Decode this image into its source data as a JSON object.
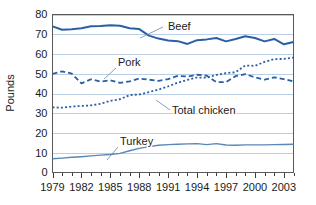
{
  "chart_data": {
    "type": "line",
    "title": "",
    "xlabel": "",
    "ylabel": "Pounds",
    "xlim": [
      1979,
      2004
    ],
    "ylim": [
      0,
      80
    ],
    "ytick_step": 10,
    "grid": true,
    "grid_axis": "y",
    "legend_position": "inline-annotations",
    "x": [
      1979,
      1980,
      1981,
      1982,
      1983,
      1984,
      1985,
      1986,
      1987,
      1988,
      1989,
      1990,
      1991,
      1992,
      1993,
      1994,
      1995,
      1996,
      1997,
      1998,
      1999,
      2000,
      2001,
      2002,
      2003,
      2004
    ],
    "yticks": [
      0,
      10,
      20,
      30,
      40,
      50,
      60,
      70,
      80
    ],
    "ytick_labels": [
      "0",
      "10",
      "20",
      "30",
      "40",
      "50",
      "60",
      "70",
      "80"
    ],
    "xtick_labels": [
      "1979",
      "1982",
      "1985",
      "1988",
      "1991",
      "1994",
      "1997",
      "2000",
      "2003"
    ],
    "xticks_labeled": [
      1979,
      1982,
      1985,
      1988,
      1991,
      1994,
      1997,
      2000,
      2003
    ],
    "series": [
      {
        "name": "Beef",
        "style": "solid",
        "color": "#2a5fa5",
        "width": 2.0,
        "values": [
          74.0,
          72.3,
          72.5,
          73.0,
          74.0,
          74.2,
          74.6,
          74.3,
          73.0,
          72.6,
          69.3,
          67.8,
          66.8,
          66.5,
          65.1,
          67.0,
          67.4,
          68.1,
          66.4,
          67.6,
          69.0,
          68.1,
          66.4,
          67.6,
          64.9,
          66.1
        ]
      },
      {
        "name": "Pork",
        "style": "dashed",
        "color": "#2a5fa5",
        "width": 1.8,
        "values": [
          49.9,
          51.2,
          50.1,
          45.1,
          47.2,
          46.0,
          46.7,
          45.4,
          46.1,
          47.6,
          47.0,
          46.4,
          47.3,
          48.9,
          48.6,
          49.5,
          49.0,
          45.8,
          45.8,
          48.8,
          49.8,
          48.2,
          47.0,
          48.2,
          47.3,
          46.1
        ]
      },
      {
        "name": "Total chicken",
        "style": "dotted",
        "color": "#2a5fa5",
        "width": 1.8,
        "values": [
          33.0,
          32.8,
          33.4,
          33.7,
          34.0,
          34.8,
          36.3,
          37.1,
          39.2,
          39.5,
          40.7,
          42.0,
          43.6,
          45.5,
          46.9,
          48.1,
          48.0,
          49.4,
          50.3,
          50.8,
          54.2,
          54.0,
          56.0,
          57.4,
          57.5,
          58.2
        ]
      },
      {
        "name": "Turkey",
        "style": "solid",
        "color": "#5a86b8",
        "width": 1.4,
        "values": [
          7.0,
          7.3,
          7.7,
          8.0,
          8.4,
          8.8,
          9.1,
          9.7,
          11.0,
          12.2,
          13.1,
          13.8,
          14.1,
          14.3,
          14.5,
          14.6,
          14.1,
          14.6,
          13.9,
          13.8,
          14.0,
          14.0,
          14.0,
          14.1,
          14.2,
          14.3
        ]
      }
    ],
    "annotations": [
      {
        "label": "Beef",
        "text_x": 168,
        "text_y": 30,
        "leader_from_x": 163,
        "leader_from_y": 27,
        "leader_to_x": 140,
        "leader_to_y": 38
      },
      {
        "label": "Pork",
        "text_x": 118,
        "text_y": 66,
        "leader_from_x": 116,
        "leader_from_y": 68,
        "leader_to_x": 104,
        "leader_to_y": 79
      },
      {
        "label": "Total chicken",
        "text_x": 172,
        "text_y": 114,
        "leader_from_x": 170,
        "leader_from_y": 110,
        "leader_to_x": 156,
        "leader_to_y": 100
      },
      {
        "label": "Turkey",
        "text_x": 120,
        "text_y": 145,
        "leader_from_x": 118,
        "leader_from_y": 147,
        "leader_to_x": 107,
        "leader_to_y": 160
      }
    ]
  },
  "colors": {
    "beef": "#2a5fa5",
    "pork": "#2a5fa5",
    "total_chicken": "#2a5fa5",
    "turkey": "#5a86b8",
    "gridline": "#a9c2e0",
    "frame": "#5a5a5a",
    "text": "#1a1a1a",
    "background": "#ffffff"
  }
}
